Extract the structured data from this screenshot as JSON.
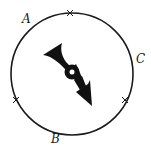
{
  "diagram": {
    "type": "spinner",
    "circle": {
      "cx": 72,
      "cy": 74,
      "r": 61,
      "stroke": "#1a1a1a"
    },
    "labels": [
      {
        "text": "A",
        "x": 22,
        "y": 23
      },
      {
        "text": "B",
        "x": 51,
        "y": 143
      },
      {
        "text": "C",
        "x": 136,
        "y": 63
      }
    ],
    "ticks": [
      {
        "name": "tick-top",
        "x": 70,
        "y": 13
      },
      {
        "name": "tick-lower-left",
        "x": 16,
        "y": 100
      },
      {
        "name": "tick-lower-right",
        "x": 125,
        "y": 100
      }
    ],
    "pointer": {
      "color": "#111111",
      "points_to": "lower-right"
    }
  }
}
